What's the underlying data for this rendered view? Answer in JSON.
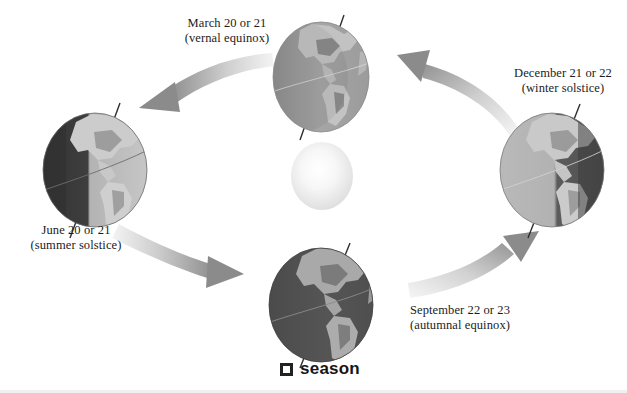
{
  "figure": {
    "caption_marker": "filled-square-bullet",
    "caption_text": "season",
    "background_color": "#ffffff"
  },
  "sun": {
    "name": "sun",
    "center_color": "#ffffff",
    "edge_color": "#e3e3e3",
    "cx": 322,
    "cy": 176,
    "rx": 31,
    "ry": 34
  },
  "positions": [
    {
      "id": "march",
      "date": "March 20 or 21",
      "event": "(vernal equinox)",
      "cx": 321,
      "cy": 77,
      "rx": 48,
      "ry": 55,
      "lit_side": "even",
      "dark_color": "#707070",
      "light_color": "#b6b6b6",
      "land_color": "#8e8e8e"
    },
    {
      "id": "june",
      "date": "June 20 or 21",
      "event": "(summer solstice)",
      "cx": 95,
      "cy": 170,
      "rx": 52,
      "ry": 57,
      "lit_side": "right",
      "dark_color": "#3c3c3c",
      "light_color": "#bdbdbd",
      "land_color": "#9a9a9a"
    },
    {
      "id": "september",
      "date": "September 22 or 23",
      "event": "(autumnal equinox)",
      "cx": 321,
      "cy": 305,
      "rx": 52,
      "ry": 57,
      "lit_side": "even",
      "dark_color": "#4a4a4a",
      "light_color": "#8c8c8c",
      "land_color": "#8a8a8a"
    },
    {
      "id": "december",
      "date": "December 21 or 22",
      "event": "(winter solstice)",
      "cx": 552,
      "cy": 170,
      "rx": 52,
      "ry": 57,
      "lit_side": "left",
      "dark_color": "#5e5e5e",
      "light_color": "#b8b8b8",
      "land_color": "#8f8f8f"
    }
  ],
  "arrows": [
    {
      "id": "december-to-march",
      "from": "december",
      "to": "march",
      "direction": "counterclockwise",
      "points_to": "upper-left"
    },
    {
      "id": "march-to-june",
      "from": "march",
      "to": "june",
      "direction": "counterclockwise",
      "points_to": "left"
    },
    {
      "id": "june-to-september",
      "from": "june",
      "to": "september",
      "direction": "counterclockwise",
      "points_to": "lower-right"
    },
    {
      "id": "september-to-december",
      "from": "september",
      "to": "december",
      "direction": "counterclockwise",
      "points_to": "upper-right"
    }
  ],
  "colors": {
    "arrow_light": "#f2f2f2",
    "arrow_dark": "#8f8f8f",
    "text": "#1c1c1c",
    "caption_marker": "#222222"
  }
}
